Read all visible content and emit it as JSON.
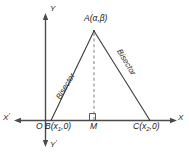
{
  "figure": {
    "colors": {
      "stroke": "#3a3a3a",
      "axis": "#4a4a4a",
      "dashed": "#8a8a8a",
      "text": "#1a1a1a",
      "background": "#ffffff"
    }
  },
  "axes": {
    "x_positive_label": "X",
    "x_negative_label": "X",
    "x_negative_prime": "'",
    "y_positive_label": "Y",
    "y_negative_label": "Y",
    "y_negative_prime": "'",
    "origin_label": "O"
  },
  "points": {
    "apex": {
      "name": "A",
      "label": "A(α,β)",
      "letter": "A",
      "coords_open": "(",
      "coord_x": "α",
      "comma": ",",
      "coord_y": "β",
      "coords_close": ")"
    },
    "left_base": {
      "name": "B",
      "letter": "B",
      "open": "(",
      "var": "x",
      "sub": "1",
      "rest": ",0)"
    },
    "midpoint": {
      "name": "M",
      "letter": "M"
    },
    "right_base": {
      "name": "C",
      "letter": "C",
      "open": "(",
      "var": "x",
      "sub": "2",
      "rest": ",0)"
    }
  },
  "annotations": {
    "bisector_left": "Bisector",
    "bisector_right": "Bisector",
    "right_angle_marker": "∟"
  }
}
